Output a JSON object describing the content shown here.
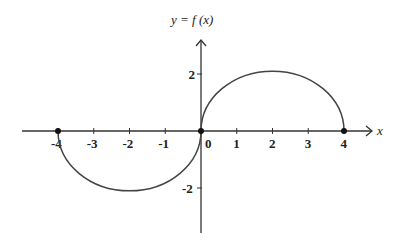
{
  "chart_data": {
    "type": "line",
    "xlabel": "x",
    "ylabel": "y = f(x)",
    "xlim": [
      -4.9,
      4.9
    ],
    "ylim": [
      -3.5,
      3.7
    ],
    "grid": false,
    "x_ticks": [
      -4,
      -3,
      -2,
      -1,
      0,
      1,
      2,
      3,
      4
    ],
    "x_tick_labels": [
      "-4",
      "-3",
      "-2",
      "-1",
      "0",
      "1",
      "2",
      "3",
      "4"
    ],
    "y_ticks": [
      2,
      -2
    ],
    "y_tick_labels": [
      "2",
      "-2"
    ],
    "series": [
      {
        "name": "f(x) left arc",
        "description": "lower semicircular-like arc from (-4,0) to (0,0)",
        "x": [
          -4,
          -3.5,
          -3,
          -2.5,
          -2,
          -1.5,
          -1,
          -0.5,
          0
        ],
        "y": [
          0,
          -1.25,
          -1.75,
          -2.0,
          -2.1,
          -2.0,
          -1.75,
          -1.25,
          0
        ]
      },
      {
        "name": "f(x) right arc",
        "description": "upper semicircular-like arc from (0,0) to (4,0)",
        "x": [
          0,
          0.5,
          1,
          1.5,
          2,
          2.5,
          3,
          3.5,
          4
        ],
        "y": [
          0,
          1.25,
          1.75,
          2.0,
          2.1,
          2.0,
          1.75,
          1.25,
          0
        ]
      }
    ],
    "points": [
      {
        "x": -4,
        "y": 0
      },
      {
        "x": 0,
        "y": 0
      },
      {
        "x": 4,
        "y": 0
      }
    ]
  },
  "labels": {
    "y_axis_title": "y = f (x)",
    "x_axis_title": "x",
    "origin": "0"
  }
}
